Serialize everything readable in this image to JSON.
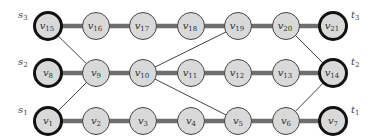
{
  "diagram": {
    "width": 376,
    "height": 137,
    "colors": {
      "node_fill": "#d9d9d9",
      "node_stroke": "#444444",
      "terminal_stroke": "#111111",
      "path_edge": "#6e6e6e",
      "cross_edge": "#444444",
      "label": "#333333"
    },
    "rows": [
      {
        "id": "row3",
        "y": 26,
        "source_label": "s",
        "source_sub": "3",
        "sink_label": "t",
        "sink_sub": "3",
        "nodes": [
          "15",
          "16",
          "17",
          "18",
          "19",
          "20",
          "21"
        ]
      },
      {
        "id": "row2",
        "y": 73,
        "source_label": "s",
        "source_sub": "2",
        "sink_label": "t",
        "sink_sub": "2",
        "nodes": [
          "8",
          "9",
          "10",
          "11",
          "12",
          "13",
          "14"
        ]
      },
      {
        "id": "row1",
        "y": 121,
        "source_label": "s",
        "source_sub": "1",
        "sink_label": "t",
        "sink_sub": "1",
        "nodes": [
          "1",
          "2",
          "3",
          "4",
          "5",
          "6",
          "7"
        ]
      }
    ],
    "columns_x": [
      48,
      96,
      143,
      191,
      238,
      286,
      333
    ],
    "node_radius": 14,
    "terminal_nodes": [
      "1",
      "7",
      "8",
      "14",
      "15",
      "21"
    ],
    "cross_edges": [
      [
        "15",
        "9"
      ],
      [
        "1",
        "9"
      ],
      [
        "10",
        "19"
      ],
      [
        "10",
        "5"
      ],
      [
        "20",
        "14"
      ],
      [
        "6",
        "14"
      ]
    ],
    "node_prefix": "v"
  }
}
